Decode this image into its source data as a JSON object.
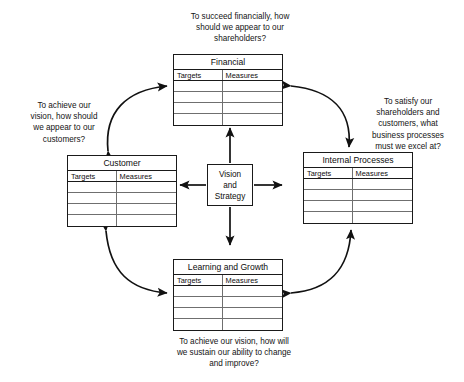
{
  "diagram": {
    "center": {
      "label": "Vision\nand\nStrategy"
    },
    "column_headers": [
      "Targets",
      "Measures"
    ],
    "empty_row_count": 4,
    "perspectives": [
      {
        "key": "financial",
        "title": "Financial",
        "caption": "To succeed financially, how\nshould we appear to our\nshareholders?",
        "targets": [
          "",
          "",
          "",
          ""
        ],
        "measures": [
          "",
          "",
          "",
          ""
        ]
      },
      {
        "key": "customer",
        "title": "Customer",
        "caption": "To achieve our\nvision, how should\nwe appear to our\ncustomers?",
        "targets": [
          "",
          "",
          "",
          ""
        ],
        "measures": [
          "",
          "",
          "",
          ""
        ]
      },
      {
        "key": "internal",
        "title": "Internal Processes",
        "caption": "To satisfy our\nshareholders and\ncustomers, what\nbusiness processes\nmust we excel at?",
        "targets": [
          "",
          "",
          "",
          ""
        ],
        "measures": [
          "",
          "",
          "",
          ""
        ]
      },
      {
        "key": "learning",
        "title": "Learning and Growth",
        "caption": "To achieve our vision, how will\nwe sustain our ability to change\nand improve?",
        "targets": [
          "",
          "",
          "",
          ""
        ],
        "measures": [
          "",
          "",
          "",
          ""
        ]
      }
    ],
    "colors": {
      "background": "#ffffff",
      "line": "#1a1a1a",
      "inner_line": "#6f6f6f",
      "text": "#0d0d0d"
    }
  }
}
